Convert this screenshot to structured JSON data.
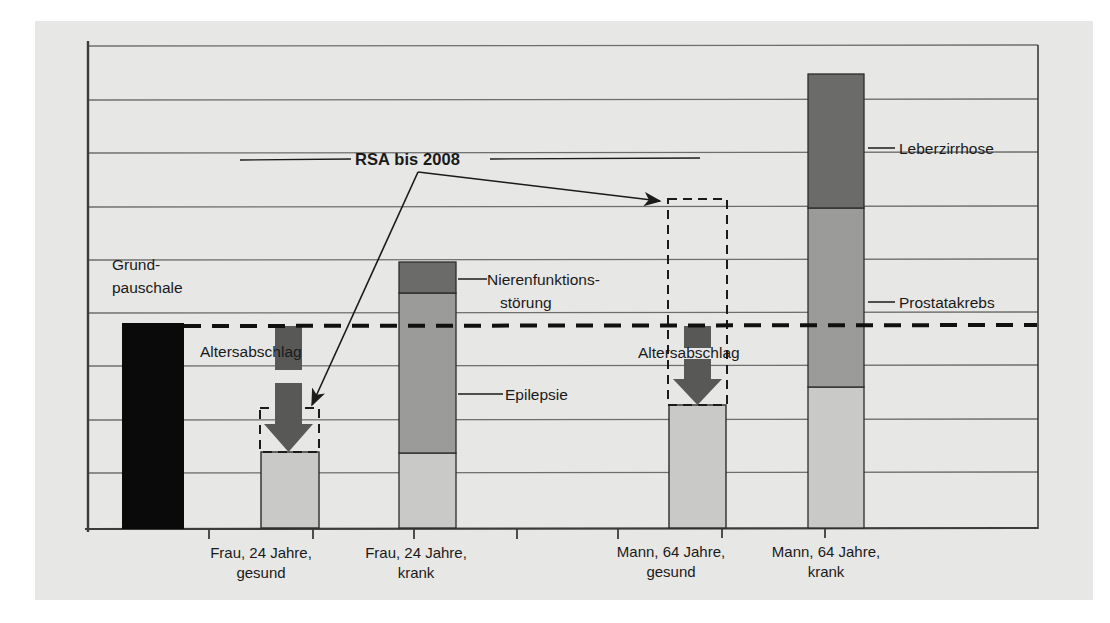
{
  "figure": {
    "background_color": "#ffffff",
    "panel_color": "#e7e7e5",
    "axis_color": "#3c3c3c",
    "gridline_color": "#6e6e6e",
    "dashed_reference_color": "#101010"
  },
  "annotations": {
    "rsa_label": "RSA bis 2008",
    "grundpauschale_line1": "Grund-",
    "grundpauschale_line2": "pauschale",
    "altersabschlag_left": "Altersabschlag",
    "altersabschlag_right": "Altersabschlag",
    "niere_line1": "Nierenfunktions-",
    "niere_line2": "störung",
    "epilepsie": "Epilepsie",
    "leberzirrhose": "Leberzirrhose",
    "prostatakrebs": "Prostatakrebs"
  },
  "colors": {
    "base_black": "#0a0a0a",
    "light_gray": "#c9c9c7",
    "mid_gray": "#9b9b99",
    "dark_gray": "#6b6b69",
    "arrow_gray": "#585856"
  },
  "chart_data": {
    "type": "bar",
    "title": "",
    "xlabel": "",
    "ylabel": "",
    "grid": true,
    "legend_position": "inline-callouts",
    "axis_rows": 9,
    "ylim": [
      0,
      9
    ],
    "reference_line": {
      "label": "Grundpauschale / RSA bis 2008",
      "value": 3.75,
      "style": "dashed"
    },
    "categories": [
      "Grundpauschale",
      "Frau, 24 Jahre, gesund",
      "Frau, 24 Jahre, krank",
      "Mann, 64 Jahre, gesund",
      "Mann, 64 Jahre, krank"
    ],
    "bars": [
      {
        "category": "Grundpauschale",
        "tick_label": "",
        "total": 3.75,
        "segments": [
          {
            "name": "Grundpauschale",
            "value": 3.75,
            "color": "#0a0a0a"
          }
        ]
      },
      {
        "category": "Frau, 24 Jahre, gesund",
        "tick_label": "Frau, 24 Jahre,\ngesund",
        "total": 1.38,
        "segments": [
          {
            "name": "Grundpauschale nach Altersabschlag",
            "value": 1.38,
            "color": "#c9c9c7"
          }
        ],
        "deduction": {
          "name": "Altersabschlag",
          "from": 3.75,
          "to": 1.38
        }
      },
      {
        "category": "Frau, 24 Jahre, krank",
        "tick_label": "Frau, 24 Jahre,\nkrank",
        "total": 4.95,
        "segments": [
          {
            "name": "Grundpauschale",
            "value": 1.38,
            "color": "#c9c9c7"
          },
          {
            "name": "Epilepsie",
            "value": 2.99,
            "color": "#9b9b99"
          },
          {
            "name": "Nierenfunktionsstörung",
            "value": 0.58,
            "color": "#6b6b69"
          }
        ]
      },
      {
        "category": "Mann, 64 Jahre, gesund",
        "tick_label": "Mann, 64 Jahre,\ngesund",
        "total": 2.27,
        "segments": [
          {
            "name": "Grundpauschale nach Altersabschlag",
            "value": 2.27,
            "color": "#c9c9c7"
          }
        ],
        "deduction": {
          "name": "Altersabschlag",
          "from": 6.15,
          "to": 2.27
        }
      },
      {
        "category": "Mann, 64 Jahre, krank",
        "tick_label": "Mann, 64 Jahre,\nkrank",
        "total": 8.45,
        "segments": [
          {
            "name": "Grundpauschale",
            "value": 2.55,
            "color": "#c9c9c7"
          },
          {
            "name": "Prostatakrebs",
            "value": 3.35,
            "color": "#9b9b99"
          },
          {
            "name": "Leberzirrhose",
            "value": 2.55,
            "color": "#6b6b69"
          }
        ]
      }
    ]
  }
}
